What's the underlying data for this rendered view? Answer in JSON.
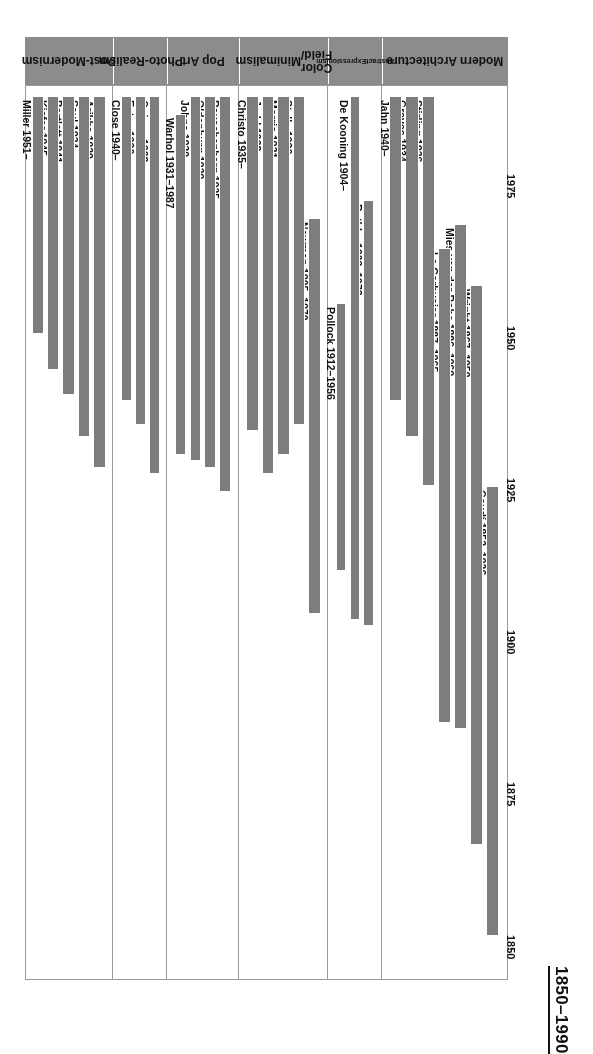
{
  "title": "1850–1990",
  "axis": {
    "ticks": [
      1850,
      1875,
      1900,
      1925,
      1950,
      1975
    ],
    "min": 1845,
    "max": 1992
  },
  "categories": [
    {
      "id": "modern-architecture",
      "label": "Modern Architecture",
      "lines": [
        "Modern Architecture"
      ],
      "font_size": 12
    },
    {
      "id": "abstract-expressionism",
      "label": "Abstract Expressionism",
      "lines": [
        "Abstract",
        "Expressionism"
      ],
      "font_size": 7
    },
    {
      "id": "color-field-minimalism",
      "label": "Color Field/Minimalism",
      "lines": [
        "Color Field/",
        "Minimalism"
      ],
      "font_size": 12
    },
    {
      "id": "pop-art",
      "label": "Pop Art",
      "lines": [
        "Pop Art"
      ],
      "font_size": 12
    },
    {
      "id": "photo-realism",
      "label": "Photo-Realism",
      "lines": [
        "Photo-",
        "Realism"
      ],
      "font_size": 12
    },
    {
      "id": "post-modernism",
      "label": "Post-Modernism",
      "lines": [
        "Post-",
        "Modernism"
      ],
      "font_size": 12
    }
  ],
  "colors": {
    "bar": "#7d7d7d",
    "category_strip": "#8c8c8c",
    "frame": "#9a9a9a",
    "text": "#111111",
    "background": "#ffffff"
  },
  "chart_data": {
    "type": "bar",
    "orientation": "timeline-gantt",
    "title": "1850–1990",
    "xlabel": "",
    "ylabel": "Year",
    "ylim": [
      1845,
      1992
    ],
    "grid": false,
    "legend": "none",
    "tick_labels": [
      "1850",
      "1875",
      "1900",
      "1925",
      "1950",
      "1975"
    ],
    "groups": [
      {
        "name": "Modern Architecture",
        "items": [
          {
            "label": "Gaudí 1852–1926",
            "name": "Gaudí",
            "start": 1852,
            "end": 1926,
            "living": false
          },
          {
            "label": "Wright 1867–1959",
            "name": "Wright",
            "start": 1867,
            "end": 1959,
            "living": false
          },
          {
            "label": "Mies van der Rohe 1886–1969",
            "name": "Mies van der Rohe",
            "start": 1886,
            "end": 1969,
            "living": false
          },
          {
            "label": "Le Corbusier 1887–1965",
            "name": "Le Corbusier",
            "start": 1887,
            "end": 1965,
            "living": false
          },
          {
            "label": "Stirling 1926–",
            "name": "Stirling",
            "start": 1926,
            "end": 1990,
            "living": true
          },
          {
            "label": "Graves 1934–",
            "name": "Graves",
            "start": 1934,
            "end": 1990,
            "living": true
          },
          {
            "label": "Jahn 1940–",
            "name": "Jahn",
            "start": 1940,
            "end": 1990,
            "living": true
          }
        ]
      },
      {
        "name": "Abstract Expressionism",
        "items": [
          {
            "label": "Rothko 1903–1973",
            "name": "Rothko",
            "start": 1903,
            "end": 1973,
            "living": false
          },
          {
            "label": "De Kooning 1904–",
            "name": "De Kooning",
            "start": 1904,
            "end": 1990,
            "living": true
          },
          {
            "label": "Pollock 1912–1956",
            "name": "Pollock",
            "start": 1912,
            "end": 1956,
            "living": false
          }
        ]
      },
      {
        "name": "Color Field/Minimalism",
        "items": [
          {
            "label": "Newman 1905–1970",
            "name": "Newman",
            "start": 1905,
            "end": 1970,
            "living": false
          },
          {
            "label": "Stella 1936–",
            "name": "Stella",
            "start": 1936,
            "end": 1990,
            "living": true
          },
          {
            "label": "Morris 1931–",
            "name": "Morris",
            "start": 1931,
            "end": 1990,
            "living": true
          },
          {
            "label": "Judd 1928–",
            "name": "Judd",
            "start": 1928,
            "end": 1990,
            "living": true
          },
          {
            "label": "Christo 1935–",
            "name": "Christo",
            "start": 1935,
            "end": 1990,
            "living": true
          }
        ]
      },
      {
        "name": "Pop Art",
        "items": [
          {
            "label": "Rauschenberg 1925–",
            "name": "Rauschenberg",
            "start": 1925,
            "end": 1990,
            "living": true
          },
          {
            "label": "Oldenburg 1929–",
            "name": "Oldenburg",
            "start": 1929,
            "end": 1990,
            "living": true
          },
          {
            "label": "Johns 1930–",
            "name": "Johns",
            "start": 1930,
            "end": 1990,
            "living": true
          },
          {
            "label": "Warhol 1931–1987",
            "name": "Warhol",
            "start": 1931,
            "end": 1987,
            "living": false
          }
        ]
      },
      {
        "name": "Photo-Realism",
        "items": [
          {
            "label": "Goings 1928–",
            "name": "Goings",
            "start": 1928,
            "end": 1990,
            "living": true
          },
          {
            "label": "Estes 1936–",
            "name": "Estes",
            "start": 1936,
            "end": 1990,
            "living": true
          },
          {
            "label": "Close 1940–",
            "name": "Close",
            "start": 1940,
            "end": 1990,
            "living": true
          }
        ]
      },
      {
        "name": "Post-Modernism",
        "items": [
          {
            "label": "Arikha 1929–",
            "name": "Arikha",
            "start": 1929,
            "end": 1990,
            "living": true
          },
          {
            "label": "Saul 1934–",
            "name": "Saul",
            "start": 1934,
            "end": 1990,
            "living": true
          },
          {
            "label": "Bartlett 1941–",
            "name": "Bartlett",
            "start": 1941,
            "end": 1990,
            "living": true
          },
          {
            "label": "Kiefer 1945–",
            "name": "Kiefer",
            "start": 1945,
            "end": 1990,
            "living": true
          },
          {
            "label": "Miller 1951–",
            "name": "Miller",
            "start": 1951,
            "end": 1990,
            "living": true
          }
        ]
      }
    ]
  }
}
